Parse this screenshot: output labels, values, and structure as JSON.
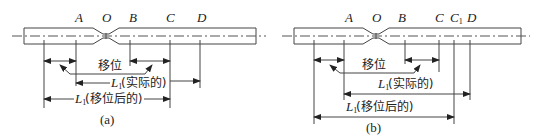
{
  "figure_a": {
    "caption": "(a)",
    "points": {
      "A": "A",
      "O": "O",
      "B": "B",
      "C": "C",
      "D": "D"
    },
    "shift_label": "移位",
    "actual_label_symbol": "L",
    "actual_label_sub": "1",
    "actual_label_text": "(实际的)",
    "shifted_label_symbol": "L",
    "shifted_label_sub": "1",
    "shifted_label_text": "(移位后的)"
  },
  "figure_b": {
    "caption": "(b)",
    "points": {
      "A": "A",
      "O": "O",
      "B": "B",
      "C": "C",
      "C1": "C",
      "C1_sub": "1",
      "D": "D"
    },
    "shift_label": "移位",
    "actual_label_symbol": "L",
    "actual_label_sub": "1",
    "actual_label_text": "(实际的)",
    "shifted_label_symbol": "L",
    "shifted_label_sub": "1",
    "shifted_label_text": "(移位后的)"
  },
  "colors": {
    "line": "#444444",
    "text": "#222222",
    "background": "#ffffff"
  }
}
